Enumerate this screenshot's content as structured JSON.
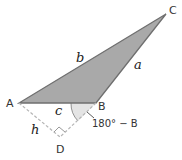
{
  "diagram": {
    "vertices": {
      "A": "A",
      "B": "B",
      "C": "C",
      "D": "D"
    },
    "sides": {
      "a": "a",
      "b": "b",
      "c": "c",
      "h": "h"
    },
    "angle_label": "180° − B",
    "colors": {
      "fill": "#a9a9a9",
      "stroke": "#6f6f6f",
      "dashed": "#b5b5b5",
      "angle_fill": "#e4e4e4"
    }
  }
}
